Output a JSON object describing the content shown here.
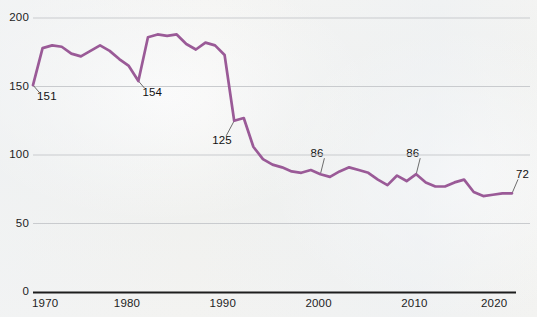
{
  "chart_data": {
    "type": "line",
    "title": "",
    "subtitle": "",
    "xlabel": "",
    "ylabel": "",
    "xlim": [
      1970,
      2020
    ],
    "ylim": [
      0,
      200
    ],
    "grid": true,
    "grid_axis": "y",
    "legend": "none",
    "series_color": "#9a5a97",
    "axis_color": "#1d1d1d",
    "gridline_color": "#c9cbce",
    "x_ticks": [
      "1970",
      "1980",
      "1990",
      "2000",
      "2010",
      "2020"
    ],
    "x_tick_values": [
      1970,
      1980,
      1990,
      2000,
      2010,
      2020
    ],
    "y_ticks": [
      "0",
      "50",
      "100",
      "150",
      "200"
    ],
    "y_tick_values": [
      0,
      50,
      100,
      150,
      200
    ],
    "x": [
      1970,
      1971,
      1972,
      1973,
      1974,
      1975,
      1976,
      1977,
      1978,
      1979,
      1980,
      1981,
      1982,
      1983,
      1984,
      1985,
      1986,
      1987,
      1988,
      1989,
      1990,
      1991,
      1992,
      1993,
      1994,
      1995,
      1996,
      1997,
      1998,
      1999,
      2000,
      2001,
      2002,
      2003,
      2004,
      2005,
      2006,
      2007,
      2008,
      2009,
      2010,
      2011,
      2012,
      2013,
      2014,
      2015,
      2016,
      2017,
      2018,
      2019,
      2020
    ],
    "values": [
      151,
      178,
      180,
      179,
      174,
      172,
      176,
      180,
      176,
      170,
      165,
      154,
      186,
      188,
      187,
      188,
      181,
      177,
      182,
      180,
      173,
      125,
      127,
      106,
      97,
      93,
      91,
      88,
      87,
      89,
      86,
      84,
      88,
      91,
      89,
      87,
      82,
      78,
      85,
      81,
      86,
      80,
      77,
      77,
      80,
      82,
      73,
      70,
      71,
      72,
      72
    ],
    "annotations": [
      {
        "label": "151",
        "x": 1970,
        "y": 151
      },
      {
        "label": "154",
        "x": 1981,
        "y": 154
      },
      {
        "label": "125",
        "x": 1991,
        "y": 125
      },
      {
        "label": "86",
        "x": 2000,
        "y": 86
      },
      {
        "label": "86",
        "x": 2010,
        "y": 86
      },
      {
        "label": "72",
        "x": 2020,
        "y": 72
      }
    ]
  }
}
